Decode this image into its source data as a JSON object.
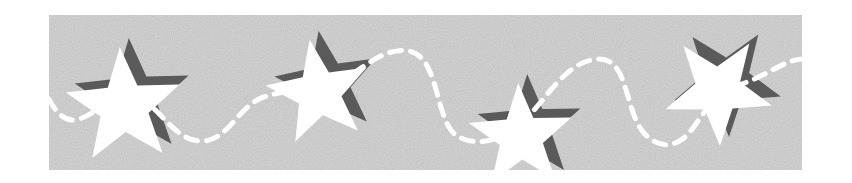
{
  "banner": {
    "description": "Decorative star banner with dashed wavy line",
    "colors": {
      "page_background": "#ffffff",
      "panel_background": "#c4c4c4",
      "panel_noise_light": "#d2d2d2",
      "panel_noise_dark": "#b4b4b4",
      "star_fill": "#ffffff",
      "star_shadow": "#5a5a5a",
      "dash_stroke": "#ffffff"
    },
    "panel": {
      "x": 49,
      "y": 15,
      "width": 753,
      "height": 155
    },
    "stars": [
      {
        "name": "star-1",
        "cx": 75,
        "cy": 92,
        "r": 60,
        "rotation": -4
      },
      {
        "name": "star-2",
        "cx": 270,
        "cy": 78,
        "r": 54,
        "rotation": -10
      },
      {
        "name": "star-3",
        "cx": 472,
        "cy": 122,
        "r": 54,
        "rotation": -3
      },
      {
        "name": "star-4",
        "cx": 669,
        "cy": 75,
        "r": 56,
        "rotation": 34
      }
    ],
    "shadow_offset": {
      "dx": 9,
      "dy": -9
    },
    "dash_path": "M 0 84 C 8 100, 18 108, 30 104 C 50 98, 60 80, 75 80 C 110 80, 120 128, 155 126 C 180 124, 190 90, 215 82 C 245 72, 255 80, 275 75 C 300 68, 330 30, 360 36 C 392 42, 385 110, 410 122 C 430 132, 450 125, 470 110 C 495 90, 515 45, 550 44 C 580 44, 575 95, 595 118 C 610 135, 628 132, 640 118 C 655 100, 662 80, 690 70 C 720 60, 735 45, 753 44",
    "dash_pattern": "12 9",
    "dash_width": 5
  }
}
